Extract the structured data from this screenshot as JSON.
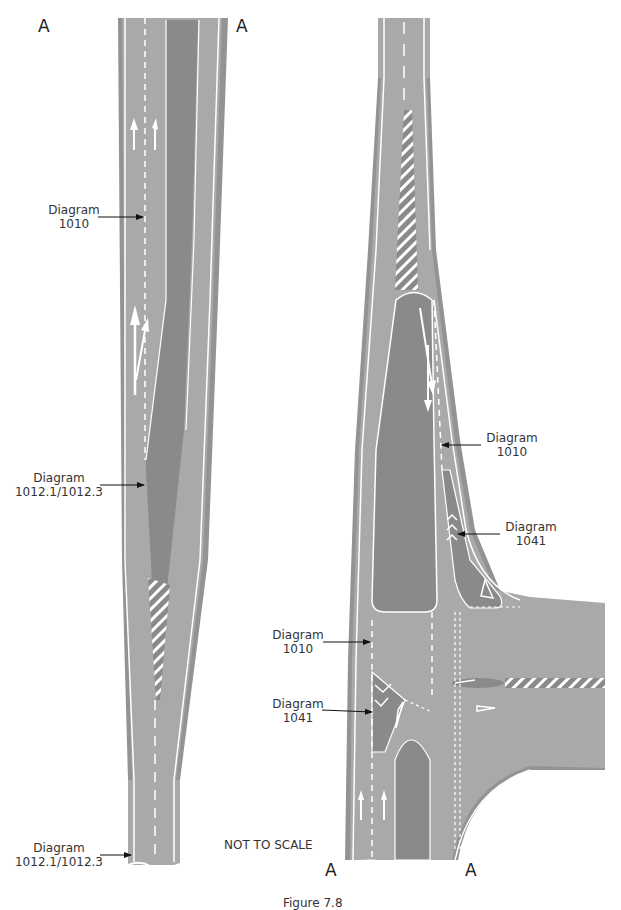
{
  "colors": {
    "carriageway": "#a9a9a9",
    "verge": "#939393",
    "island": "#8a8a8a",
    "marking": "#ffffff",
    "text": "#333333"
  },
  "left_diagram": {
    "match_labels": {
      "top_left": "A",
      "top_right": "A"
    },
    "callouts": [
      {
        "line1": "Diagram",
        "line2": "1010"
      },
      {
        "line1": "Diagram",
        "line2": "1012.1/1012.3"
      },
      {
        "line1": "Diagram",
        "line2": "1012.1/1012.3"
      }
    ]
  },
  "right_diagram": {
    "match_labels": {
      "bottom_left": "A",
      "bottom_right": "A"
    },
    "callouts": [
      {
        "line1": "Diagram",
        "line2": "1010"
      },
      {
        "line1": "Diagram",
        "line2": "1041"
      },
      {
        "line1": "Diagram",
        "line2": "1010"
      },
      {
        "line1": "Diagram",
        "line2": "1041"
      }
    ]
  },
  "note": "NOT TO SCALE",
  "caption": "Figure 7.8"
}
